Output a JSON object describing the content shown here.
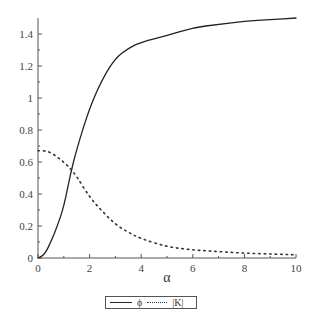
{
  "chart_data": {
    "type": "line",
    "title": "",
    "xlabel": "α",
    "ylabel": "",
    "xlim": [
      0,
      10
    ],
    "ylim": [
      0,
      1.5
    ],
    "grid": false,
    "legend_position": "bottom",
    "x_ticks": [
      "0",
      "2",
      "4",
      "6",
      "8",
      "10"
    ],
    "y_ticks": [
      "0",
      "0.2",
      "0.4",
      "0.6",
      "0.8",
      "1",
      "1.2",
      "1.4"
    ],
    "x": [
      0,
      0.25,
      0.5,
      0.75,
      1,
      1.25,
      1.5,
      2,
      2.5,
      3,
      3.5,
      4,
      5,
      6,
      7,
      8,
      9,
      10
    ],
    "series": [
      {
        "name": "ϕ",
        "style": "solid",
        "values": [
          0,
          0.02,
          0.1,
          0.2,
          0.32,
          0.52,
          0.68,
          0.94,
          1.12,
          1.25,
          1.31,
          1.35,
          1.39,
          1.44,
          1.46,
          1.48,
          1.49,
          1.5
        ]
      },
      {
        "name": "|K|",
        "style": "dotted",
        "values": [
          0.67,
          0.67,
          0.66,
          0.63,
          0.6,
          0.56,
          0.51,
          0.38,
          0.29,
          0.21,
          0.16,
          0.12,
          0.07,
          0.05,
          0.04,
          0.03,
          0.025,
          0.02
        ]
      }
    ]
  },
  "legend": {
    "items": [
      "ϕ",
      "|K|"
    ]
  }
}
